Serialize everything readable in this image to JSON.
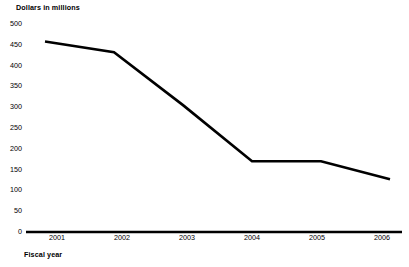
{
  "chart_data": {
    "type": "line",
    "title": "",
    "ylabel": "Dollars in millions",
    "xlabel": "Fiscal year",
    "categories": [
      "2001",
      "2002",
      "2003",
      "2004",
      "2005",
      "2006"
    ],
    "values": [
      458,
      432,
      305,
      170,
      170,
      127
    ],
    "series": [
      {
        "name": "Dollars in millions",
        "values": [
          458,
          432,
          305,
          170,
          170,
          127
        ]
      }
    ],
    "ylim": [
      0,
      500
    ],
    "yticks": [
      0,
      50,
      100,
      150,
      200,
      250,
      300,
      350,
      400,
      450,
      500
    ],
    "ytick_labels": [
      "0",
      "50",
      "100",
      "150",
      "200",
      "250",
      "300",
      "350",
      "400",
      "450",
      "500"
    ],
    "xtick_labels": [
      "2001",
      "2002",
      "2003",
      "2004",
      "2005",
      "2006"
    ],
    "grid": false,
    "legend": false,
    "legend_position": "none",
    "line_color": "#000000",
    "axis_color": "#000000",
    "background_color": "#ffffff"
  }
}
